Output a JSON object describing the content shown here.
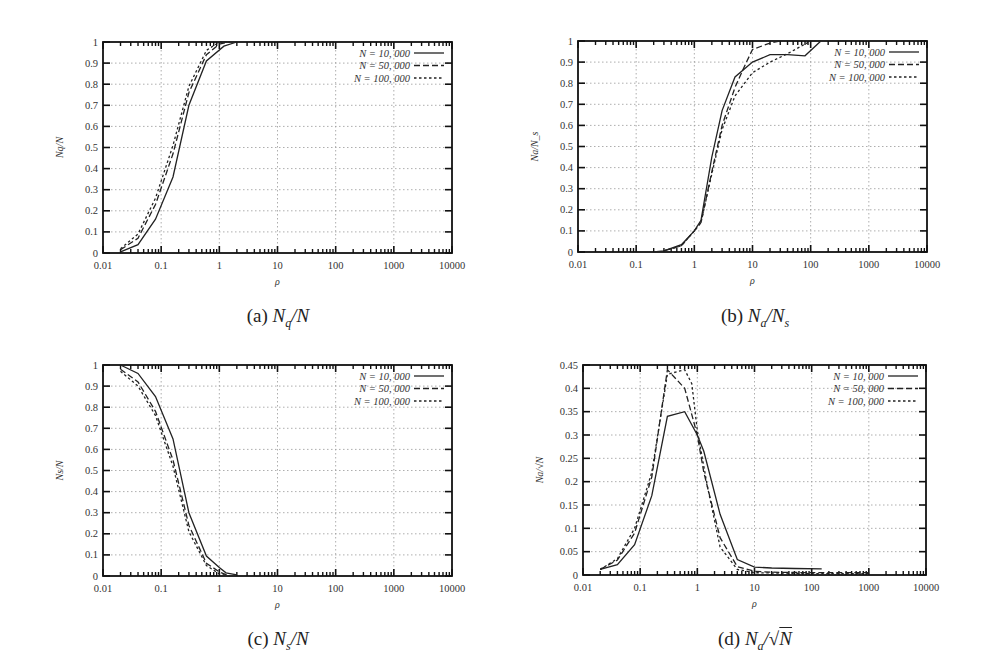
{
  "figure": {
    "legend": [
      {
        "label": "N = 10, 000",
        "style": "solid"
      },
      {
        "label": "N = 50, 000",
        "style": "dashed"
      },
      {
        "label": "N = 100, 000",
        "style": "dotted"
      }
    ],
    "x_ticks": [
      "0.01",
      "0.1",
      "1",
      "10",
      "100",
      "1000",
      "10000"
    ],
    "x_tick_values": [
      0.01,
      0.1,
      1,
      10,
      100,
      1000,
      10000
    ]
  },
  "captions": {
    "a": {
      "prefix": "(a)",
      "math": "Nq/N"
    },
    "b": {
      "prefix": "(b)",
      "math": "Na/Ns"
    },
    "c": {
      "prefix": "(c)",
      "math": "Ns/N"
    },
    "d": {
      "prefix": "(d)",
      "math": "Na/√N"
    }
  },
  "chart_data": [
    {
      "id": "a",
      "type": "line",
      "title": "(a) N_q/N",
      "xlabel": "ρ",
      "ylabel": "N_q/N",
      "xscale": "log",
      "xlim": [
        0.01,
        10000
      ],
      "ylim": [
        0,
        1
      ],
      "y_ticks": [
        "0",
        "0.1",
        "0.2",
        "0.3",
        "0.4",
        "0.5",
        "0.6",
        "0.7",
        "0.8",
        "0.9",
        "1"
      ],
      "grid": true,
      "legend_position": "top-right",
      "frame": {
        "x0": 103,
        "y0": 42,
        "x1": 452,
        "y1": 253
      },
      "series": [
        {
          "name": "N = 10,000",
          "style": "solid",
          "x": [
            0.02,
            0.04,
            0.08,
            0.16,
            0.3,
            0.6,
            1.2,
            2.0
          ],
          "y": [
            0.005,
            0.04,
            0.16,
            0.36,
            0.7,
            0.91,
            0.98,
            1.0
          ]
        },
        {
          "name": "N = 50,000",
          "style": "dashed",
          "x": [
            0.02,
            0.04,
            0.08,
            0.16,
            0.3,
            0.6,
            1.0,
            1.5
          ],
          "y": [
            0.015,
            0.07,
            0.23,
            0.47,
            0.76,
            0.94,
            0.99,
            1.0
          ]
        },
        {
          "name": "N = 100,000",
          "style": "dotted",
          "x": [
            0.02,
            0.04,
            0.08,
            0.16,
            0.3,
            0.6,
            1.0,
            1.5
          ],
          "y": [
            0.02,
            0.09,
            0.26,
            0.51,
            0.79,
            0.96,
            1.0,
            1.0
          ]
        }
      ]
    },
    {
      "id": "b",
      "type": "line",
      "title": "(b) N_a/N_s",
      "xlabel": "ρ",
      "ylabel": "N_a/N_s",
      "xscale": "log",
      "xlim": [
        0.01,
        10000
      ],
      "ylim": [
        0,
        1
      ],
      "y_ticks": [
        "0",
        "0.1",
        "0.2",
        "0.3",
        "0.4",
        "0.5",
        "0.6",
        "0.7",
        "0.8",
        "0.9",
        "1"
      ],
      "grid": true,
      "legend_position": "top-right",
      "frame": {
        "x0": 578,
        "y0": 41,
        "x1": 927,
        "y1": 252
      },
      "series": [
        {
          "name": "N = 10,000",
          "style": "solid",
          "x": [
            0.2,
            0.3,
            0.6,
            1.0,
            1.3,
            2.0,
            3.0,
            5.0,
            10,
            20,
            40,
            80,
            150
          ],
          "y": [
            0.0,
            0.005,
            0.035,
            0.1,
            0.15,
            0.45,
            0.67,
            0.83,
            0.9,
            0.935,
            0.935,
            0.93,
            1.0
          ]
        },
        {
          "name": "N = 50,000",
          "style": "dashed",
          "x": [
            0.3,
            0.6,
            1.0,
            1.3,
            2.0,
            3.0,
            5.0,
            7.0,
            10,
            20,
            30
          ],
          "y": [
            0.005,
            0.03,
            0.1,
            0.14,
            0.38,
            0.6,
            0.78,
            0.87,
            0.96,
            0.99,
            1.0
          ]
        },
        {
          "name": "N = 100,000",
          "style": "dotted",
          "x": [
            0.3,
            0.6,
            1.0,
            1.3,
            2.0,
            3.0,
            5.0,
            10,
            20,
            40,
            100
          ],
          "y": [
            0.005,
            0.03,
            0.1,
            0.14,
            0.37,
            0.58,
            0.74,
            0.85,
            0.9,
            0.94,
            1.0
          ]
        }
      ]
    },
    {
      "id": "c",
      "type": "line",
      "title": "(c) N_s/N",
      "xlabel": "ρ",
      "ylabel": "N_s/N",
      "xscale": "log",
      "xlim": [
        0.01,
        10000
      ],
      "ylim": [
        0,
        1
      ],
      "y_ticks": [
        "0",
        "0.1",
        "0.2",
        "0.3",
        "0.4",
        "0.5",
        "0.6",
        "0.7",
        "0.8",
        "0.9",
        "1"
      ],
      "grid": true,
      "legend_position": "top-right",
      "frame": {
        "x0": 103,
        "y0": 365,
        "x1": 452,
        "y1": 576
      },
      "series": [
        {
          "name": "N = 10,000",
          "style": "solid",
          "x": [
            0.02,
            0.04,
            0.08,
            0.16,
            0.3,
            0.6,
            1.0,
            1.3,
            2.0
          ],
          "y": [
            1.0,
            0.96,
            0.85,
            0.65,
            0.3,
            0.095,
            0.04,
            0.015,
            0.005
          ]
        },
        {
          "name": "N = 50,000",
          "style": "dashed",
          "x": [
            0.02,
            0.04,
            0.08,
            0.16,
            0.3,
            0.6,
            1.0,
            1.5
          ],
          "y": [
            0.98,
            0.92,
            0.78,
            0.55,
            0.24,
            0.06,
            0.02,
            0.0
          ]
        },
        {
          "name": "N = 100,000",
          "style": "dotted",
          "x": [
            0.02,
            0.04,
            0.08,
            0.16,
            0.3,
            0.6,
            1.0,
            1.5
          ],
          "y": [
            0.97,
            0.9,
            0.76,
            0.52,
            0.21,
            0.05,
            0.01,
            0.0
          ]
        }
      ]
    },
    {
      "id": "d",
      "type": "line",
      "title": "(d) N_a/√N",
      "xlabel": "ρ",
      "ylabel": "N_a/√N",
      "xscale": "log",
      "xlim": [
        0.01,
        10000
      ],
      "ylim": [
        0,
        0.45
      ],
      "y_ticks": [
        "0",
        "0.05",
        "0.1",
        "0.15",
        "0.2",
        "0.25",
        "0.3",
        "0.35",
        "0.4",
        "0.45"
      ],
      "grid": true,
      "legend_position": "top-right",
      "frame": {
        "x0": 583,
        "y0": 365,
        "x1": 926,
        "y1": 575
      },
      "series": [
        {
          "name": "N = 10,000",
          "style": "solid",
          "x": [
            0.02,
            0.04,
            0.08,
            0.16,
            0.3,
            0.6,
            1.0,
            1.3,
            2.5,
            5.0,
            10,
            20,
            50,
            150
          ],
          "y": [
            0.012,
            0.022,
            0.065,
            0.17,
            0.34,
            0.35,
            0.3,
            0.265,
            0.13,
            0.033,
            0.017,
            0.015,
            0.014,
            0.013
          ]
        },
        {
          "name": "N = 50,000",
          "style": "dashed",
          "x": [
            0.02,
            0.04,
            0.08,
            0.16,
            0.3,
            0.6,
            1.0,
            1.3,
            2.5,
            5.0,
            10,
            20,
            100,
            1000
          ],
          "y": [
            0.012,
            0.032,
            0.09,
            0.21,
            0.44,
            0.4,
            0.3,
            0.22,
            0.08,
            0.018,
            0.008,
            0.006,
            0.005,
            0.005
          ]
        },
        {
          "name": "N = 100,000",
          "style": "dotted",
          "x": [
            0.02,
            0.04,
            0.08,
            0.16,
            0.3,
            0.6,
            0.8,
            1.0,
            1.5,
            2.5,
            5.0,
            10,
            100,
            1000
          ],
          "y": [
            0.012,
            0.035,
            0.1,
            0.22,
            0.43,
            0.44,
            0.41,
            0.31,
            0.19,
            0.06,
            0.012,
            0.005,
            0.003,
            0.003
          ]
        }
      ]
    }
  ]
}
